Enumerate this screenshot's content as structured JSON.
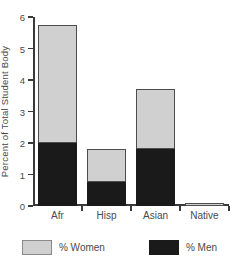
{
  "chart_data": {
    "type": "bar",
    "barmode": "stacked",
    "title": "STUDENT ENROLLMENT",
    "xlabel": "",
    "ylabel": "Percent of Total Student Body",
    "categories": [
      "Afr",
      "Hisp",
      "Asian",
      "Native"
    ],
    "series": [
      {
        "name": "% Men",
        "color": "#1a1a1a",
        "values": [
          2.0,
          0.75,
          1.8,
          0.0
        ]
      },
      {
        "name": "% Women",
        "color": "#d0d0d0",
        "values": [
          3.75,
          1.05,
          1.9,
          0.1
        ]
      }
    ],
    "totals": [
      5.75,
      1.8,
      3.7,
      0.1
    ],
    "ylim": [
      0,
      6
    ],
    "yticks": [
      0,
      1,
      2,
      3,
      4,
      5,
      6
    ],
    "ytick_labels": [
      "0",
      "1",
      "2",
      "3",
      "4",
      "5",
      "6"
    ],
    "grid": false,
    "legend_position": "bottom"
  },
  "legend": {
    "items": [
      {
        "label": "% Women",
        "color": "#d0d0d0"
      },
      {
        "label": "% Men",
        "color": "#1a1a1a"
      }
    ]
  }
}
